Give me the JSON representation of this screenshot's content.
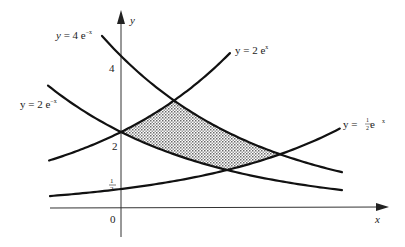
{
  "figure": {
    "axis_labels": {
      "x": "x",
      "y": "y"
    },
    "tick_labels": {
      "origin": "0",
      "four": "4",
      "two": "2",
      "half_num": "1",
      "half_den": "2"
    },
    "curve_labels": {
      "c1": {
        "prefix": "y = 4 e",
        "exp": "−x"
      },
      "c2": {
        "prefix": "y = 2 e",
        "exp": "x"
      },
      "c3": {
        "prefix": "y = 2 e",
        "exp": "−x"
      },
      "c4": {
        "prefix": "y = ",
        "frac_num": "1",
        "frac_den": "2",
        "suffix": " e",
        "exp": "x"
      }
    },
    "colors": {
      "curve": "#111111",
      "axis": "#333333",
      "shade_dot": "#777777",
      "background": "#ffffff"
    }
  },
  "chart_data": {
    "type": "line",
    "title": "",
    "xlabel": "x",
    "ylabel": "y",
    "xlim": [
      -0.47,
      1.75
    ],
    "ylim": [
      -0.75,
      5.2
    ],
    "yticks": [
      {
        "value": 0.5,
        "label": "1/2"
      },
      {
        "value": 2,
        "label": "2"
      },
      {
        "value": 4,
        "label": "4"
      }
    ],
    "xticks": [
      {
        "value": 0,
        "label": "0"
      }
    ],
    "grid": false,
    "series": [
      {
        "name": "y = 4 e^-x",
        "expr": "4*exp(-x)",
        "domain": [
          -0.124,
          1.444
        ]
      },
      {
        "name": "y = 2 e^x",
        "expr": "2*exp(x)",
        "domain": [
          -0.47,
          0.712
        ]
      },
      {
        "name": "y = 2 e^-x",
        "expr": "2*exp(-x)",
        "domain": [
          -0.477,
          1.444
        ]
      },
      {
        "name": "y = 1/2 e^x",
        "expr": "0.5*exp(x)",
        "domain": [
          -0.464,
          1.43
        ]
      }
    ],
    "shaded_region": {
      "description": "Region bounded above by min(4e^-x, 2e^x) and below by max(2e^-x, 1/2 e^x)",
      "vertices": [
        {
          "x": 0,
          "y": 2
        },
        {
          "x": 0.347,
          "y": 2.828
        },
        {
          "x": 1.04,
          "y": 1.414
        },
        {
          "x": 0.693,
          "y": 1.0
        }
      ]
    },
    "transform": {
      "origin_px": [
        121,
        208
      ],
      "x_scale": 153,
      "y_scale": 38
    }
  }
}
